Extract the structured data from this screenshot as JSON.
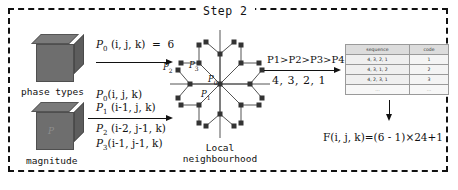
{
  "figure": {
    "title": "Step 2",
    "left_column": {
      "cube_top": {
        "caption": "phase types",
        "icon": "voxel-cube-icon"
      },
      "cube_bottom": {
        "caption": "magnitude",
        "mark": "P",
        "icon": "voxel-cube-icon"
      }
    },
    "arrow_top_label": "P₀ (i, j, k) = 6",
    "arrow_bottom_labels_above": [
      "P₀ (i, j, k)",
      "P₁ (i-1, j, k)"
    ],
    "arrow_bottom_labels_below": [
      "P₂ (i-2, j-1, k)",
      "P₃ (i-1, j-1, k)"
    ],
    "neighbourhood": {
      "caption_line1": "Local",
      "caption_line2": "neighbourhood",
      "node_labels": [
        "P₂",
        "P₃",
        "P₀",
        "P₁"
      ]
    },
    "middle_arrow": {
      "above": "P1>P2>P3>P4",
      "below": "4, 3, 2, 1"
    },
    "table": {
      "headers": [
        "sequence",
        "code"
      ],
      "rows": [
        [
          "4, 3, 2, 1",
          "1"
        ],
        [
          "4, 3, 1, 2",
          "2"
        ],
        [
          "4, 2, 3, 1",
          "3"
        ],
        [
          "...",
          "..."
        ]
      ]
    },
    "result_formula": "F(i, j, k)=(6 - 1)×24+1"
  }
}
